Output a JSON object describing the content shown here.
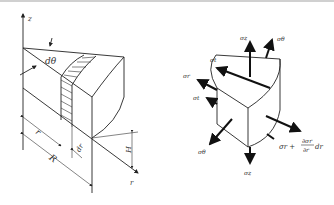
{
  "figure": {
    "left": {
      "title": "Cylindrical wedge element",
      "labels": {
        "z_axis": "z",
        "r_axis": "r",
        "dtheta": "dθ",
        "r": "r",
        "dr": "dr",
        "R": "R",
        "H": "H"
      }
    },
    "right": {
      "title": "Stress components on element",
      "labels": {
        "sigma_z_top": "σz",
        "sigma_theta_top": "σθ",
        "sigma_t_upper": "σt",
        "sigma_r_left": "σr",
        "sigma_t_lower": "σt",
        "sigma_theta_bottom": "σθ",
        "sigma_z_bottom": "σz",
        "sigma_r_right_base": "σr +",
        "partial_num": "∂σr",
        "partial_den": "∂r",
        "dr_suffix": "dr"
      }
    }
  },
  "colors": {
    "line": "#222222",
    "background": "#ffffff",
    "top_border": "#d0d0d0"
  }
}
